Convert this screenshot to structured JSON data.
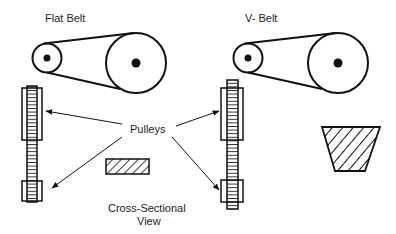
{
  "labels": {
    "flat_belt": "Flat Belt",
    "v_belt": "V- Belt",
    "pulleys": "Pulleys",
    "cross_section_line1": "Cross-Sectional",
    "cross_section_line2": "View"
  },
  "colors": {
    "stroke": "#111111",
    "text": "#222222",
    "background": "#ffffff"
  }
}
